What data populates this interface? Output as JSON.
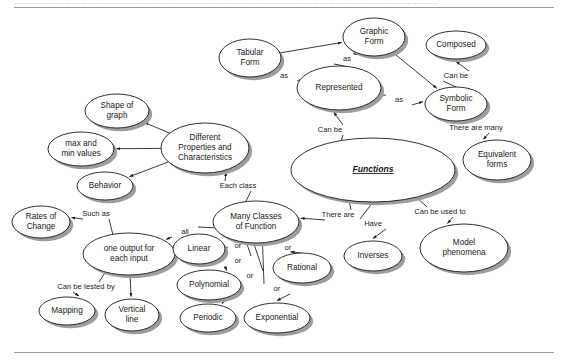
{
  "page": {
    "background_color": "#ffffff",
    "rule_color": "#9a9a9a",
    "node_fill": "#ffffff",
    "node_stroke": "#1a1a1a",
    "shadow_color": "#9d9d9d",
    "header_ghost_text": "~~~~~~~~~~~~~~~~~~~~~~~~~~~~~~~~~~~~~~~~~~~~~~~~~~~~~~~~~~~~~~~~~~~~~~~~~~~~~~~~~~"
  },
  "diagram": {
    "type": "concept-map",
    "nodes": [
      {
        "id": "tabular_form",
        "label": "Tabular\nForm",
        "cx": 250,
        "cy": 58,
        "rx": 31,
        "ry": 19
      },
      {
        "id": "graphic_form",
        "label": "Graphic\nForm",
        "cx": 374,
        "cy": 37,
        "rx": 31,
        "ry": 19
      },
      {
        "id": "composed",
        "label": "Composed",
        "cx": 456,
        "cy": 45,
        "rx": 30,
        "ry": 14
      },
      {
        "id": "represented",
        "label": "Represented",
        "cx": 339,
        "cy": 88,
        "rx": 42,
        "ry": 22
      },
      {
        "id": "symbolic_form",
        "label": "Symbolic\nForm",
        "cx": 456,
        "cy": 104,
        "rx": 31,
        "ry": 17
      },
      {
        "id": "equivalent",
        "label": "Equivalent\nforms",
        "cx": 497,
        "cy": 160,
        "rx": 34,
        "ry": 20
      },
      {
        "id": "shape_of_graph",
        "label": "Shape of\ngraph",
        "cx": 117,
        "cy": 111,
        "rx": 32,
        "ry": 17
      },
      {
        "id": "different_props",
        "label": "Different\nProperties and\nCharacteristics",
        "cx": 205,
        "cy": 148,
        "rx": 44,
        "ry": 25
      },
      {
        "id": "max_min",
        "label": "max and\nmin values",
        "cx": 81,
        "cy": 149,
        "rx": 33,
        "ry": 17
      },
      {
        "id": "behavior",
        "label": "Behavior",
        "cx": 105,
        "cy": 186,
        "rx": 28,
        "ry": 14
      },
      {
        "id": "functions",
        "label": "Functions",
        "cx": 373,
        "cy": 170,
        "rx": 82,
        "ry": 32,
        "central": true
      },
      {
        "id": "rates_of_change",
        "label": "Rates of\nChange",
        "cx": 41,
        "cy": 222,
        "rx": 29,
        "ry": 16
      },
      {
        "id": "many_classes",
        "label": "Many Classes\nof Function",
        "cx": 256,
        "cy": 222,
        "rx": 43,
        "ry": 21
      },
      {
        "id": "one_output",
        "label": "one output for\neach input",
        "cx": 129,
        "cy": 254,
        "rx": 46,
        "ry": 21
      },
      {
        "id": "linear",
        "label": "Linear",
        "cx": 199,
        "cy": 249,
        "rx": 26,
        "ry": 15
      },
      {
        "id": "polynomial",
        "label": "Polynomial",
        "cx": 209,
        "cy": 285,
        "rx": 32,
        "ry": 15
      },
      {
        "id": "periodic",
        "label": "Periodic",
        "cx": 208,
        "cy": 318,
        "rx": 28,
        "ry": 14
      },
      {
        "id": "exponential",
        "label": "Exponential",
        "cx": 277,
        "cy": 318,
        "rx": 33,
        "ry": 15
      },
      {
        "id": "rational",
        "label": "Rational",
        "cx": 302,
        "cy": 268,
        "rx": 29,
        "ry": 15
      },
      {
        "id": "mapping",
        "label": "Mapping",
        "cx": 67,
        "cy": 311,
        "rx": 28,
        "ry": 14
      },
      {
        "id": "vertical_line",
        "label": "Vertical\nline",
        "cx": 132,
        "cy": 315,
        "rx": 27,
        "ry": 16
      },
      {
        "id": "inverses",
        "label": "Inverses",
        "cx": 373,
        "cy": 256,
        "rx": 29,
        "ry": 15
      },
      {
        "id": "model_phenomena",
        "label": "Model\nphenomena",
        "cx": 464,
        "cy": 248,
        "rx": 44,
        "ry": 24
      }
    ],
    "links": [
      {
        "id": "represented_as_tabular",
        "label": "as",
        "lx": 284,
        "ly": 76,
        "from": "represented",
        "to": "tabular_form"
      },
      {
        "id": "represented_as_graphic",
        "label": "as",
        "lx": 347,
        "ly": 59,
        "from": "represented",
        "to": "graphic_form"
      },
      {
        "id": "represented_as_symbolic",
        "label": "as",
        "lx": 399,
        "ly": 100,
        "from": "represented",
        "to": "symbolic_form"
      },
      {
        "id": "tabular_to_graphic",
        "label": "",
        "lx": 0,
        "ly": 0,
        "from": "tabular_form",
        "to": "graphic_form"
      },
      {
        "id": "graphic_to_symbolic",
        "label": "",
        "lx": 0,
        "ly": 0,
        "from": "graphic_form",
        "to": "symbolic_form"
      },
      {
        "id": "symbolic_can_be",
        "label": "Can be",
        "lx": 456,
        "ly": 76,
        "from": "symbolic_form",
        "to": "composed"
      },
      {
        "id": "symbolic_there_are_many",
        "label": "There are many",
        "lx": 476,
        "ly": 128,
        "from": "symbolic_form",
        "to": "equivalent"
      },
      {
        "id": "functions_can_be",
        "label": "Can be",
        "lx": 330,
        "ly": 130,
        "from": "functions",
        "to": "represented"
      },
      {
        "id": "props_shape",
        "label": "",
        "lx": 0,
        "ly": 0,
        "from": "different_props",
        "to": "shape_of_graph"
      },
      {
        "id": "props_maxmin",
        "label": "",
        "lx": 0,
        "ly": 0,
        "from": "different_props",
        "to": "max_min"
      },
      {
        "id": "props_behavior",
        "label": "",
        "lx": 0,
        "ly": 0,
        "from": "different_props",
        "to": "behavior"
      },
      {
        "id": "classes_each_class",
        "label": "Each class",
        "lx": 238,
        "ly": 186,
        "from": "many_classes",
        "to": "different_props"
      },
      {
        "id": "classes_all",
        "label": "all",
        "lx": 185,
        "ly": 232,
        "from": "many_classes",
        "to": "one_output"
      },
      {
        "id": "functions_there_are",
        "label": "There are",
        "lx": 338,
        "ly": 215,
        "from": "functions",
        "to": "many_classes"
      },
      {
        "id": "functions_have",
        "label": "Have",
        "lx": 373,
        "ly": 224,
        "from": "functions",
        "to": "inverses"
      },
      {
        "id": "functions_can_be_used",
        "label": "Can be used to",
        "lx": 440,
        "ly": 212,
        "from": "functions",
        "to": "model_phenomena"
      },
      {
        "id": "output_such_as",
        "label": "Such as",
        "lx": 96,
        "ly": 214,
        "from": "one_output",
        "to": "rates_of_change"
      },
      {
        "id": "output_tested_by",
        "label": "Can be tested by",
        "lx": 86,
        "ly": 287,
        "from": "one_output",
        "to": "mapping"
      },
      {
        "id": "output_vertical",
        "label": "",
        "lx": 0,
        "ly": 0,
        "from": "one_output",
        "to": "vertical_line"
      },
      {
        "id": "classes_or_linear",
        "label": "or",
        "lx": 238,
        "ly": 246,
        "from": "many_classes",
        "to": "linear"
      },
      {
        "id": "classes_or_polynomial",
        "label": "or",
        "lx": 238,
        "ly": 261,
        "from": "many_classes",
        "to": "polynomial"
      },
      {
        "id": "classes_or_periodic",
        "label": "or",
        "lx": 250,
        "ly": 276,
        "from": "many_classes",
        "to": "periodic"
      },
      {
        "id": "classes_or_exponential",
        "label": "or",
        "lx": 277,
        "ly": 289,
        "from": "many_classes",
        "to": "exponential"
      },
      {
        "id": "classes_or_rational",
        "label": "or",
        "lx": 288,
        "ly": 248,
        "from": "many_classes",
        "to": "rational"
      }
    ]
  }
}
